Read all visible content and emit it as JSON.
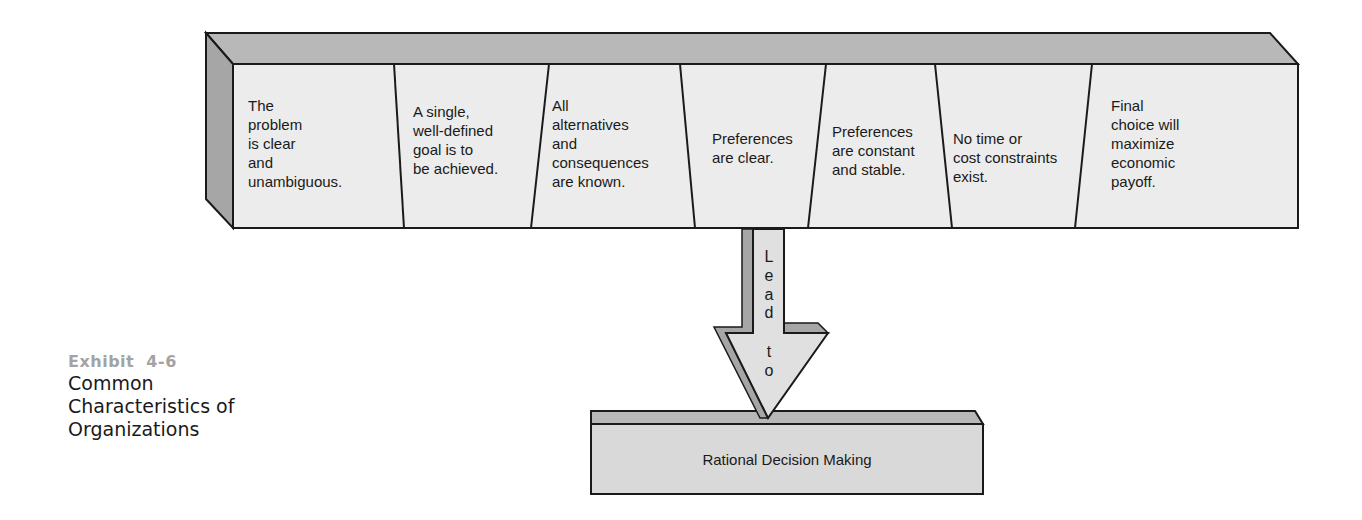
{
  "diagram": {
    "characteristics": [
      {
        "text": "The\nproblem\nis clear\nand\nunambiguous."
      },
      {
        "text": "A single,\nwell-defined\ngoal is to\nbe achieved."
      },
      {
        "text": "All\nalternatives\nand\nconsequences\nare known."
      },
      {
        "text": "Preferences\nare clear."
      },
      {
        "text": "Preferences\nare constant\nand stable."
      },
      {
        "text": "No time or\ncost constraints\nexist."
      },
      {
        "text": "Final\nchoice will\nmaximize\neconomic\npayoff."
      }
    ],
    "arrow": {
      "letters": [
        "L",
        "e",
        "a",
        "d",
        "",
        "t",
        "o"
      ],
      "label": "Lead to"
    },
    "result": {
      "label": "Rational Decision Making"
    },
    "colors": {
      "face": "#ececec",
      "top": "#b8b8b8",
      "side": "#a6a6a6",
      "stroke": "#1a1a1a",
      "result_face": "#d9d9d9",
      "exhibit_label": "#a3a3a3"
    }
  },
  "caption": {
    "exhibit_label": "Exhibit  4-6",
    "title": "Common\nCharacteristics of\nOrganizations"
  }
}
